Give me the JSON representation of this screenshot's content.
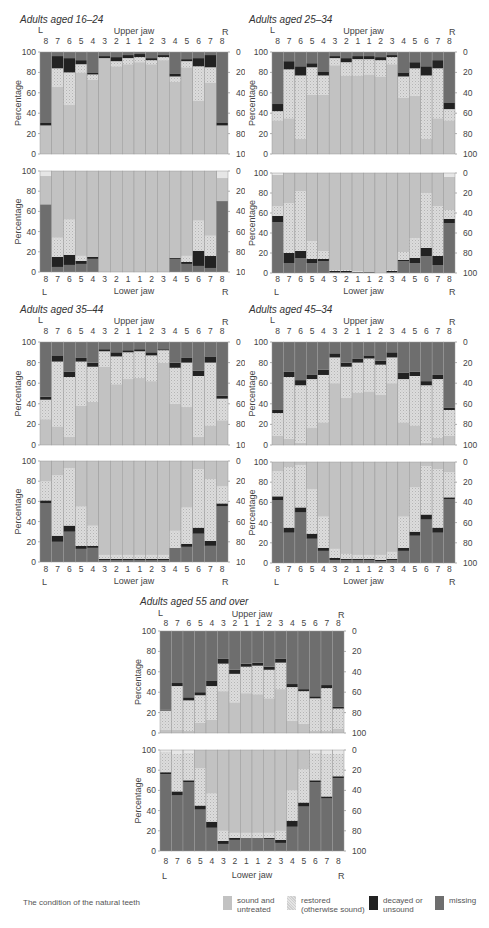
{
  "colors": {
    "sound": "#c2c2c2",
    "restored": "#dcdcdc",
    "decayed": "#222222",
    "missing": "#6e6e6e",
    "plot_bg": "#e6e6e6",
    "bar_border": "#9a9a9a"
  },
  "common_labels": {
    "upper_jaw": "Upper jaw",
    "lower_jaw": "Lower jaw",
    "left": "L",
    "right": "R",
    "ylabel": "Percentage",
    "teeth": [
      "8",
      "7",
      "6",
      "5",
      "4",
      "3",
      "2",
      "1",
      "1",
      "2",
      "3",
      "4",
      "5",
      "6",
      "7",
      "8"
    ],
    "left_ticks": [
      "100",
      "80",
      "60",
      "40",
      "20",
      "0"
    ],
    "right_ticks": [
      "0",
      "20",
      "40",
      "60",
      "80",
      "100"
    ]
  },
  "legend": {
    "caption": "The condition of the natural teeth",
    "items": [
      {
        "key": "sound",
        "label_line1": "sound and",
        "label_line2": "untreated"
      },
      {
        "key": "restored",
        "label_line1": "restored",
        "label_line2": "(otherwise sound)"
      },
      {
        "key": "decayed",
        "label_line1": "decayed or",
        "label_line2": "unsound"
      },
      {
        "key": "missing",
        "label_line1": "missing",
        "label_line2": ""
      }
    ]
  },
  "chart_data": [
    {
      "type": "bar",
      "stacked": true,
      "title": "Adults aged 16–24",
      "categories": [
        "L8",
        "L7",
        "L6",
        "L5",
        "L4",
        "L3",
        "L2",
        "L1",
        "R1",
        "R2",
        "R3",
        "R4",
        "R5",
        "R6",
        "R7",
        "R8"
      ],
      "series_order": [
        "sound",
        "restored",
        "decayed",
        "missing"
      ],
      "ylabel": "Percentage",
      "ylim": [
        0,
        100
      ],
      "upper_jaw": {
        "sound": [
          28,
          66,
          48,
          80,
          73,
          94,
          86,
          88,
          90,
          88,
          92,
          71,
          85,
          52,
          70,
          28
        ],
        "restored": [
          0,
          18,
          32,
          8,
          5,
          0,
          5,
          6,
          5,
          4,
          3,
          5,
          6,
          34,
          15,
          0
        ],
        "decayed": [
          3,
          12,
          14,
          4,
          2,
          2,
          4,
          3,
          3,
          2,
          2,
          3,
          2,
          8,
          12,
          3
        ],
        "missing": [
          69,
          4,
          6,
          8,
          20,
          4,
          5,
          3,
          2,
          6,
          3,
          21,
          7,
          6,
          3,
          69
        ]
      },
      "lower_jaw": {
        "missing": [
          67,
          5,
          7,
          8,
          13,
          0,
          0,
          0,
          0,
          0,
          0,
          13,
          8,
          6,
          4,
          69
        ],
        "decayed": [
          0,
          10,
          10,
          3,
          2,
          0,
          0,
          0,
          0,
          0,
          0,
          1,
          2,
          15,
          12,
          1
        ],
        "restored": [
          0,
          19,
          35,
          5,
          0,
          0,
          0,
          0,
          0,
          0,
          0,
          0,
          6,
          30,
          20,
          0
        ],
        "sound": [
          28,
          66,
          48,
          84,
          85,
          100,
          100,
          100,
          100,
          100,
          100,
          86,
          84,
          49,
          64,
          23
        ]
      }
    },
    {
      "type": "bar",
      "stacked": true,
      "title": "Adults aged 25–34",
      "categories": [
        "L8",
        "L7",
        "L6",
        "L5",
        "L4",
        "L3",
        "L2",
        "L1",
        "R1",
        "R2",
        "R3",
        "R4",
        "R5",
        "R6",
        "R7",
        "R8"
      ],
      "series_order": [
        "sound",
        "restored",
        "decayed",
        "missing"
      ],
      "ylabel": "Percentage",
      "ylim": [
        0,
        100
      ],
      "upper_jaw": {
        "sound": [
          33,
          35,
          15,
          58,
          58,
          87,
          77,
          77,
          78,
          76,
          88,
          55,
          57,
          15,
          35,
          33
        ],
        "restored": [
          9,
          48,
          62,
          27,
          19,
          7,
          13,
          16,
          15,
          16,
          7,
          21,
          27,
          62,
          49,
          11
        ],
        "decayed": [
          7,
          8,
          9,
          4,
          4,
          2,
          4,
          3,
          3,
          3,
          2,
          4,
          6,
          9,
          8,
          6
        ],
        "missing": [
          51,
          9,
          14,
          11,
          19,
          4,
          6,
          4,
          4,
          5,
          3,
          20,
          10,
          14,
          8,
          50
        ]
      },
      "lower_jaw": {
        "missing": [
          51,
          10,
          15,
          10,
          12,
          1,
          1,
          1,
          1,
          0,
          1,
          12,
          10,
          17,
          8,
          50
        ],
        "decayed": [
          6,
          10,
          7,
          4,
          2,
          1,
          1,
          0,
          0,
          0,
          1,
          1,
          5,
          8,
          9,
          4
        ],
        "restored": [
          10,
          50,
          60,
          18,
          8,
          1,
          1,
          1,
          0,
          0,
          1,
          8,
          20,
          55,
          50,
          9
        ],
        "sound": [
          31,
          30,
          18,
          68,
          78,
          97,
          97,
          98,
          99,
          100,
          97,
          79,
          65,
          20,
          33,
          33
        ]
      }
    },
    {
      "type": "bar",
      "stacked": true,
      "title": "Adults aged 35–44",
      "categories": [
        "L8",
        "L7",
        "L6",
        "L5",
        "L4",
        "L3",
        "L2",
        "L1",
        "R1",
        "R2",
        "R3",
        "R4",
        "R5",
        "R6",
        "R7",
        "R8"
      ],
      "series_order": [
        "sound",
        "restored",
        "decayed",
        "missing"
      ],
      "ylabel": "Percentage",
      "ylim": [
        0,
        100
      ],
      "upper_jaw": {
        "sound": [
          25,
          18,
          8,
          38,
          42,
          76,
          59,
          64,
          65,
          62,
          80,
          40,
          37,
          8,
          19,
          24
        ],
        "restored": [
          19,
          63,
          58,
          43,
          34,
          15,
          27,
          26,
          26,
          25,
          12,
          35,
          43,
          59,
          61,
          21
        ],
        "decayed": [
          3,
          6,
          5,
          4,
          4,
          2,
          4,
          2,
          2,
          3,
          1,
          5,
          5,
          5,
          6,
          3
        ],
        "missing": [
          53,
          13,
          29,
          15,
          20,
          7,
          10,
          8,
          7,
          10,
          7,
          20,
          15,
          28,
          14,
          52
        ]
      },
      "lower_jaw": {
        "missing": [
          58,
          20,
          30,
          13,
          14,
          2,
          2,
          2,
          2,
          2,
          2,
          14,
          15,
          28,
          16,
          55
        ],
        "decayed": [
          3,
          6,
          6,
          3,
          2,
          1,
          1,
          1,
          1,
          1,
          1,
          0,
          3,
          6,
          5,
          3
        ],
        "restored": [
          19,
          60,
          57,
          39,
          20,
          4,
          4,
          4,
          4,
          4,
          4,
          17,
          36,
          58,
          61,
          17
        ],
        "sound": [
          20,
          14,
          7,
          45,
          64,
          93,
          93,
          93,
          93,
          93,
          93,
          69,
          46,
          8,
          18,
          25
        ]
      }
    },
    {
      "type": "bar",
      "stacked": true,
      "title": "Adults aged 45–34",
      "categories": [
        "L8",
        "L7",
        "L6",
        "L5",
        "L4",
        "L3",
        "L2",
        "L1",
        "R1",
        "R2",
        "R3",
        "R4",
        "R5",
        "R6",
        "R7",
        "R8"
      ],
      "series_order": [
        "sound",
        "restored",
        "decayed",
        "missing"
      ],
      "ylabel": "Percentage",
      "ylim": [
        0,
        100
      ],
      "upper_jaw": {
        "sound": [
          9,
          6,
          2,
          17,
          22,
          60,
          46,
          51,
          52,
          49,
          60,
          22,
          19,
          2,
          7,
          9
        ],
        "restored": [
          22,
          60,
          56,
          47,
          46,
          25,
          30,
          29,
          32,
          29,
          25,
          42,
          48,
          56,
          57,
          25
        ],
        "decayed": [
          3,
          5,
          5,
          4,
          5,
          4,
          4,
          4,
          3,
          4,
          5,
          6,
          4,
          4,
          4,
          2
        ],
        "missing": [
          66,
          29,
          37,
          32,
          27,
          11,
          20,
          16,
          13,
          18,
          10,
          30,
          29,
          38,
          32,
          64
        ]
      },
      "lower_jaw": {
        "missing": [
          62,
          30,
          50,
          24,
          12,
          3,
          3,
          3,
          3,
          2,
          3,
          12,
          27,
          43,
          30,
          63
        ],
        "decayed": [
          4,
          5,
          5,
          5,
          3,
          2,
          1,
          1,
          1,
          1,
          1,
          3,
          4,
          5,
          5,
          2
        ],
        "restored": [
          25,
          60,
          42,
          44,
          31,
          9,
          5,
          4,
          4,
          5,
          7,
          31,
          44,
          48,
          58,
          25
        ],
        "sound": [
          9,
          5,
          3,
          27,
          54,
          86,
          91,
          92,
          92,
          92,
          89,
          54,
          25,
          4,
          7,
          10
        ]
      }
    },
    {
      "type": "bar",
      "stacked": true,
      "title": "Adults aged 55 and over",
      "categories": [
        "L8",
        "L7",
        "L6",
        "L5",
        "L4",
        "L3",
        "L2",
        "L1",
        "R1",
        "R2",
        "R3",
        "R4",
        "R5",
        "R6",
        "R7",
        "R8"
      ],
      "series_order": [
        "sound",
        "restored",
        "decayed",
        "missing"
      ],
      "ylabel": "Percentage",
      "ylim": [
        0,
        100
      ],
      "upper_jaw": {
        "sound": [
          3,
          3,
          2,
          10,
          13,
          41,
          30,
          39,
          38,
          34,
          43,
          12,
          9,
          2,
          2,
          4
        ],
        "restored": [
          19,
          43,
          30,
          27,
          33,
          27,
          28,
          26,
          28,
          28,
          26,
          33,
          32,
          32,
          42,
          20
        ],
        "decayed": [
          1,
          3,
          3,
          3,
          5,
          5,
          4,
          3,
          3,
          3,
          4,
          3,
          2,
          2,
          3,
          2
        ],
        "missing": [
          77,
          51,
          65,
          60,
          49,
          27,
          38,
          32,
          31,
          35,
          27,
          52,
          57,
          64,
          53,
          74
        ]
      },
      "lower_jaw": {
        "missing": [
          76,
          55,
          68,
          41,
          23,
          7,
          11,
          13,
          13,
          12,
          8,
          24,
          44,
          68,
          52,
          72
        ],
        "decayed": [
          2,
          4,
          2,
          4,
          6,
          3,
          2,
          0,
          0,
          1,
          3,
          6,
          4,
          2,
          2,
          2
        ],
        "restored": [
          20,
          37,
          27,
          37,
          28,
          10,
          5,
          5,
          5,
          5,
          9,
          30,
          33,
          27,
          42,
          22
        ],
        "sound": [
          0,
          0,
          0,
          18,
          43,
          80,
          82,
          82,
          82,
          82,
          80,
          40,
          19,
          0,
          0,
          0
        ]
      }
    }
  ]
}
